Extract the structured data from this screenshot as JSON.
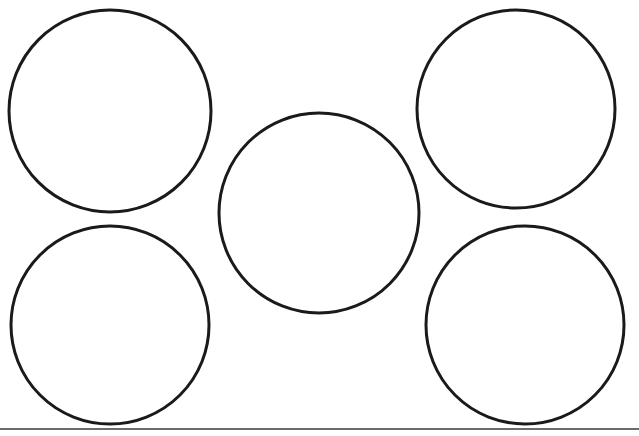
{
  "page": {
    "width": 639,
    "height": 436,
    "background_color": "#ffffff"
  },
  "style": {
    "circle_stroke_color": "#1a1a1a",
    "circle_fill_color": "#ffffff",
    "circle_stroke_width": 3,
    "rule_stroke_color": "#3b3b3b",
    "rule_stroke_width": 1.6
  },
  "figure": {
    "kind": "line-drawing",
    "shape_count": 5,
    "rule_count": 1
  },
  "shapes": [
    {
      "name": "circle-top-left",
      "type": "circle",
      "cx": 110,
      "cy": 111,
      "r": 101
    },
    {
      "name": "circle-top-right",
      "type": "circle",
      "cx": 516,
      "cy": 109,
      "r": 99
    },
    {
      "name": "circle-center",
      "type": "circle",
      "cx": 319,
      "cy": 213,
      "r": 100
    },
    {
      "name": "circle-bottom-left",
      "type": "circle",
      "cx": 110,
      "cy": 325,
      "r": 99
    },
    {
      "name": "circle-bottom-right",
      "type": "circle",
      "cx": 525,
      "cy": 325,
      "r": 99
    }
  ],
  "rules": [
    {
      "name": "horizontal-rule-bottom",
      "type": "line",
      "x1": 0,
      "y1": 429,
      "x2": 639,
      "y2": 429
    }
  ]
}
